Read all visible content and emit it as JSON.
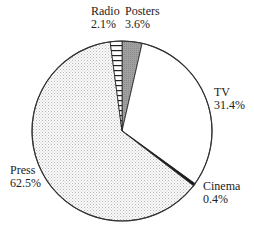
{
  "chart_data": {
    "type": "pie",
    "title": "",
    "start_angle_deg": 0,
    "direction": "clockwise",
    "slices": [
      {
        "label": "Posters",
        "value": 3.6,
        "value_label": "3.6%",
        "fill": "#a8a8a8",
        "pattern": "gray"
      },
      {
        "label": "TV",
        "value": 31.4,
        "value_label": "31.4%",
        "fill": "#ffffff",
        "pattern": "plain"
      },
      {
        "label": "Cinema",
        "value": 0.4,
        "value_label": "0.4%",
        "fill": "#111111",
        "pattern": "solid"
      },
      {
        "label": "Press",
        "value": 62.5,
        "value_label": "62.5%",
        "fill": "#f0f0f0",
        "pattern": "dots"
      },
      {
        "label": "Radio",
        "value": 2.1,
        "value_label": "2.1%",
        "fill": "#ffffff",
        "pattern": "horizontal-hatch"
      }
    ]
  },
  "labels": {
    "radio": {
      "name": "Radio",
      "pct": "2.1%"
    },
    "posters": {
      "name": "Posters",
      "pct": "3.6%"
    },
    "tv": {
      "name": "TV",
      "pct": "31.4%"
    },
    "cinema": {
      "name": "Cinema",
      "pct": "0.4%"
    },
    "press": {
      "name": "Press",
      "pct": "62.5%"
    }
  }
}
